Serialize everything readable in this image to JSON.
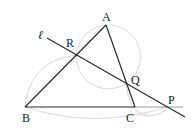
{
  "diagram": {
    "type": "geometry",
    "labels": {
      "A": "A",
      "B": "B",
      "C": "C",
      "P": "P",
      "Q": "Q",
      "R": "R",
      "line": "ℓ"
    },
    "points": {
      "A": [
        106,
        25
      ],
      "B": [
        25,
        107
      ],
      "C": [
        135,
        107
      ],
      "R": [
        77,
        55
      ],
      "Q": [
        126,
        83
      ],
      "P": [
        167,
        107
      ]
    },
    "segments": [
      [
        "A",
        "B"
      ],
      [
        "A",
        "C"
      ],
      [
        "B",
        "C"
      ]
    ],
    "line_l": {
      "through": [
        "R",
        "Q",
        "P"
      ]
    },
    "circles": [
      {
        "through": [
          "A",
          "R",
          "Q"
        ]
      },
      {
        "through": [
          "B",
          "R",
          "P"
        ]
      },
      {
        "through": [
          "C",
          "Q",
          "P"
        ]
      }
    ],
    "colors": {
      "line": "#2a2a2a",
      "circle": "#d8d8d8",
      "extension": "#9a9a9a"
    }
  }
}
